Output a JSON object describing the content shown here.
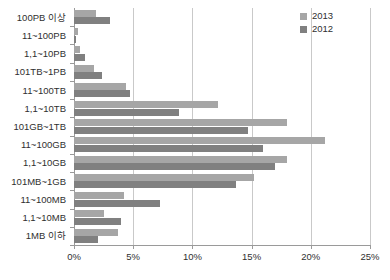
{
  "chart_data": {
    "type": "bar",
    "orientation": "horizontal",
    "title": "",
    "xlabel": "",
    "ylabel": "",
    "xlim": [
      0,
      25
    ],
    "xunit": "%",
    "xticks": [
      "0%",
      "5%",
      "10%",
      "15%",
      "20%",
      "25%"
    ],
    "xtick_values": [
      0,
      5,
      10,
      15,
      20,
      25
    ],
    "grid": true,
    "legend_position": "top-right",
    "categories": [
      "100PB 이상",
      "11~100PB",
      "1,1~10PB",
      "101TB~1PB",
      "11~100TB",
      "1,1~10TB",
      "101GB~1TB",
      "11~100GB",
      "1,1~10GB",
      "101MB~1GB",
      "11~100MB",
      "1,1~10MB",
      "1MB 이하"
    ],
    "series": [
      {
        "name": "2013",
        "color": "#a6a6a6",
        "values": [
          1.9,
          0.3,
          0.5,
          1.7,
          4.4,
          12.2,
          18.0,
          21.2,
          18.0,
          15.2,
          4.2,
          2.5,
          3.7
        ]
      },
      {
        "name": "2012",
        "color": "#808080",
        "values": [
          3.0,
          0.2,
          0.9,
          2.4,
          4.7,
          8.9,
          14.7,
          16.0,
          17.0,
          13.7,
          7.3,
          4.0,
          2.0
        ]
      }
    ]
  },
  "legend": {
    "items": [
      {
        "label": "2013",
        "color": "#a6a6a6"
      },
      {
        "label": "2012",
        "color": "#808080"
      }
    ]
  },
  "colors": {
    "series_2013": "#a6a6a6",
    "series_2012": "#808080",
    "gridline": "#c9c9c9",
    "axis": "#9a9a9a",
    "background": "#ffffff",
    "text": "#2f2f2f"
  }
}
